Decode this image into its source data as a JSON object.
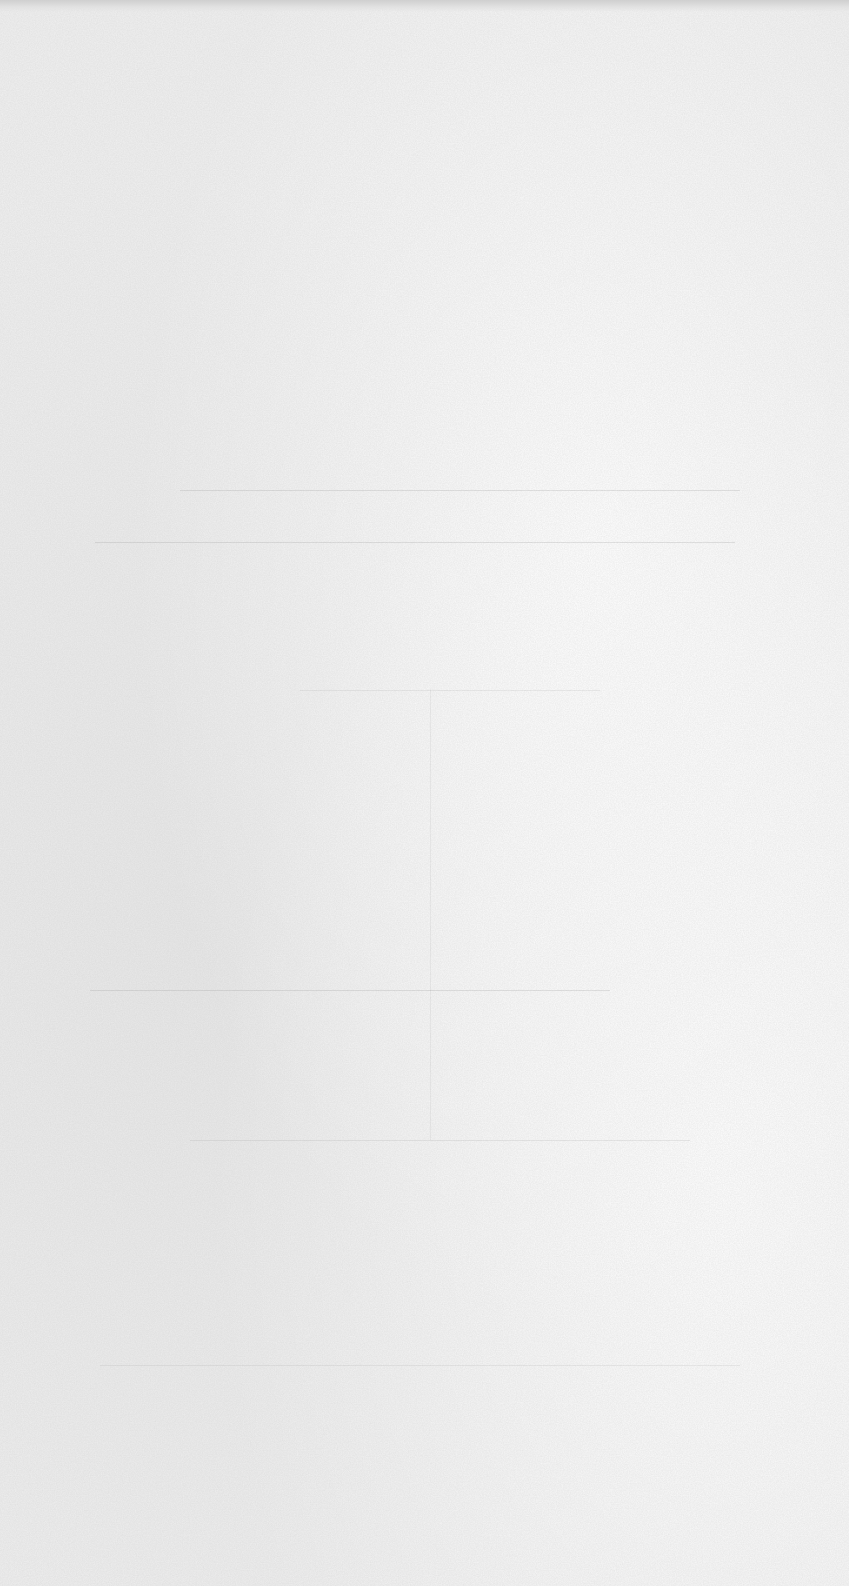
{
  "document": {
    "type": "blank-scanned-page",
    "background_color": "#efefef",
    "top_edge_shadow_color": "#cfcfcf",
    "visible_text": [],
    "ghost_marks": {
      "horizontal_lines_y": [
        490,
        542,
        690,
        990,
        1140,
        1365
      ],
      "vertical_lines_x": [
        430
      ]
    }
  }
}
